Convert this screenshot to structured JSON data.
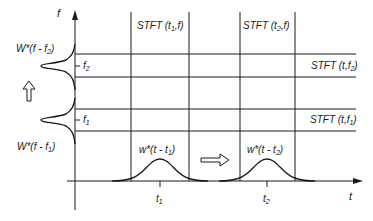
{
  "diagram": {
    "type": "time-frequency STFT tiling",
    "colors": {
      "line": "#1a1a1a",
      "background": "#ffffff"
    },
    "axes": {
      "x_label": "t",
      "y_label": "f"
    },
    "ticks": {
      "t1": "t",
      "t1_sub": "1",
      "t2": "t",
      "t2_sub": "2",
      "f1": "f",
      "f1_sub": "1",
      "f2": "f",
      "f2_sub": "2"
    },
    "labels": {
      "stft_t1": {
        "pre": "STFT (t",
        "sub": "1",
        "post": ",f)"
      },
      "stft_t2": {
        "pre": "STFT (t",
        "sub": "2",
        "post": ",f)"
      },
      "stft_f2": {
        "pre": "STFT (t,f",
        "sub": "2",
        "post": ")"
      },
      "stft_f1": {
        "pre": "STFT (t,f",
        "sub": "1",
        "post": ")"
      },
      "window_f2": {
        "pre": "W*(f - f",
        "sub": "2",
        "post": ")"
      },
      "window_f1": {
        "pre": "W*(f - f",
        "sub": "1",
        "post": ")"
      },
      "window_t1": {
        "pre": "w*(t - t",
        "sub": "1",
        "post": ")"
      },
      "window_t2": {
        "pre": "w*(t - t",
        "sub": "2",
        "post": ")"
      }
    },
    "arrows": {
      "frequency_shift": "up-arrow-icon",
      "time_shift": "right-arrow-icon"
    }
  }
}
